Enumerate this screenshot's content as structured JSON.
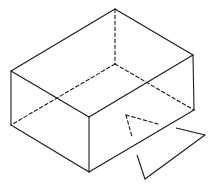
{
  "diagram": {
    "type": "isometric-box-with-view-indicator",
    "stroke_color": "#1a1a1a",
    "background": "#ffffff",
    "box": {
      "vertices": {
        "top_back": [
          115,
          9
        ],
        "top_left": [
          11,
          71
        ],
        "top_right": [
          193,
          55
        ],
        "top_front": [
          89,
          117
        ],
        "bottom_left": [
          11,
          125
        ],
        "bottom_right": [
          194,
          110
        ],
        "bottom_front": [
          89,
          172
        ],
        "bottom_back_hidden": [
          115,
          64
        ]
      },
      "visible_edges": [
        [
          [
            115,
            9
          ],
          [
            11,
            71
          ]
        ],
        [
          [
            115,
            9
          ],
          [
            193,
            55
          ]
        ],
        [
          [
            11,
            71
          ],
          [
            89,
            117
          ]
        ],
        [
          [
            193,
            55
          ],
          [
            89,
            117
          ]
        ],
        [
          [
            11,
            71
          ],
          [
            11,
            125
          ]
        ],
        [
          [
            89,
            117
          ],
          [
            89,
            172
          ]
        ],
        [
          [
            193,
            55
          ],
          [
            194,
            110
          ]
        ],
        [
          [
            11,
            125
          ],
          [
            89,
            172
          ]
        ],
        [
          [
            89,
            172
          ],
          [
            194,
            110
          ]
        ]
      ],
      "hidden_edges": [
        [
          [
            115,
            9
          ],
          [
            115,
            64
          ]
        ],
        [
          [
            115,
            64
          ],
          [
            11,
            125
          ]
        ],
        [
          [
            115,
            64
          ],
          [
            194,
            110
          ]
        ]
      ]
    },
    "view_indicator": {
      "dashed_segments": [
        [
          [
            126,
            115
          ],
          [
            158,
            124
          ]
        ],
        [
          [
            126,
            115
          ],
          [
            132,
            137
          ]
        ]
      ],
      "solid_polyline": [
        [
          176,
          128
        ],
        [
          205,
          135
        ],
        [
          145,
          179
        ],
        [
          137,
          155
        ]
      ]
    }
  }
}
